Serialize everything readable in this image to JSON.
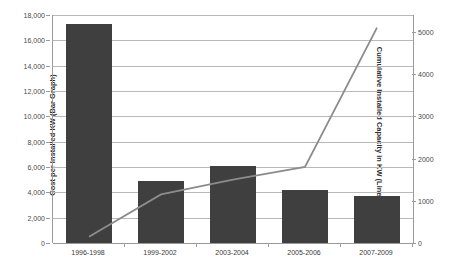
{
  "top_clipped_text": "",
  "chart_data": {
    "type": "bar",
    "title": "",
    "subtitle": "",
    "xlabel": "",
    "categories": [
      "1996-1998",
      "1999-2002",
      "2003-2004",
      "2005-2006",
      "2007-2009"
    ],
    "grid": true,
    "legend": "none",
    "bar_axis": {
      "label": "Cost per Installed KW (Bar Graph)",
      "side": "left",
      "ylim": [
        0,
        18000
      ],
      "tick_step": 2000,
      "ticks": [
        0,
        2000,
        4000,
        6000,
        8000,
        10000,
        12000,
        14000,
        16000,
        18000
      ],
      "tick_labels": [
        "0",
        "2,000",
        "4,000",
        "6,000",
        "8,000",
        "10,000",
        "12,000",
        "14,000",
        "16,000",
        "18,000"
      ],
      "color": "#3f3f3f"
    },
    "line_axis": {
      "label": "Cumulative Installed Capacity in KW (Line Graph)",
      "side": "right",
      "ylim": [
        0,
        5400
      ],
      "tick_step": 1000,
      "ticks": [
        0,
        1000,
        2000,
        3000,
        4000,
        5000
      ],
      "tick_labels": [
        "0",
        "1000",
        "2000",
        "3000",
        "4000",
        "5000"
      ],
      "color": "#8c8c8c"
    },
    "series": [
      {
        "name": "Cost per Installed KW",
        "type": "bar",
        "axis": "left",
        "values": [
          17300,
          4860,
          6080,
          4200,
          3740
        ]
      },
      {
        "name": "Cumulative Installed Capacity in KW",
        "type": "line",
        "axis": "right",
        "values": [
          150,
          1150,
          1500,
          1800,
          5100
        ]
      }
    ]
  }
}
